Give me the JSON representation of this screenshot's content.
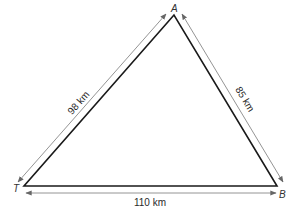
{
  "diagram": {
    "type": "triangle",
    "vertices": [
      {
        "id": "A",
        "label": "A"
      },
      {
        "id": "T",
        "label": "T"
      },
      {
        "id": "B",
        "label": "B"
      }
    ],
    "sides": [
      {
        "from": "T",
        "to": "A",
        "label": "98 km"
      },
      {
        "from": "A",
        "to": "B",
        "label": "85 km"
      },
      {
        "from": "T",
        "to": "B",
        "label": "110 km"
      }
    ],
    "colors": {
      "triangle_stroke": "#1a1a1a",
      "arrow_stroke": "#777777",
      "text": "#2a2a2a"
    }
  }
}
